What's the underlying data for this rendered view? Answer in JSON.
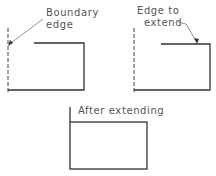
{
  "figure": {
    "panels": [
      {
        "id": "boundary",
        "label_lines": [
          "Boundary",
          "edge"
        ],
        "description": "Boundary edge (dashed) selected"
      },
      {
        "id": "edge-to-extend",
        "label_lines": [
          "Edge to",
          "extend"
        ],
        "description": "Edge to extend selected"
      },
      {
        "id": "result",
        "label_lines": [
          "After extending"
        ],
        "description": "Edge extended to the boundary"
      }
    ],
    "colors": {
      "line": "#333333",
      "text": "#555555",
      "background": "#ffffff"
    }
  }
}
